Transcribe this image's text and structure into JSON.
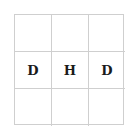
{
  "board": {
    "rows": 3,
    "cols": 3,
    "cells": [
      [
        "",
        "",
        ""
      ],
      [
        "D",
        "H",
        "D"
      ],
      [
        "",
        "",
        ""
      ]
    ]
  },
  "colors": {
    "grid_line": "#cfcfcf",
    "text": "#1a1a1a",
    "background": "#ffffff"
  }
}
